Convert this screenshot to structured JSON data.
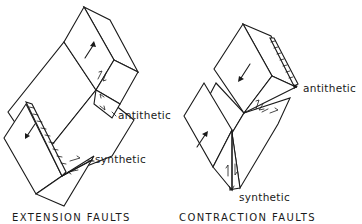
{
  "figure": {
    "panels": [
      {
        "id": "extension",
        "caption": "EXTENSION FAULTS",
        "labels": {
          "antithetic": "antithetic",
          "synthetic": "synthetic"
        }
      },
      {
        "id": "contraction",
        "caption": "CONTRACTION FAULTS",
        "labels": {
          "antithetic": "antithetic",
          "synthetic": "synthetic"
        }
      }
    ],
    "colors": {
      "ink": "#1a1a1a",
      "background": "#ffffff"
    }
  }
}
